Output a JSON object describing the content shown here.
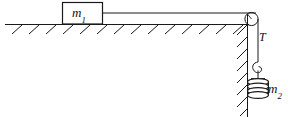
{
  "figure": {
    "kind": "physics-free-body-diagram",
    "background_color": "#ffffff",
    "line_color": "#1a1a1a"
  },
  "labels": {
    "block_mass": {
      "symbol": "m",
      "subscript": "1",
      "text": "m1"
    },
    "hanging_mass": {
      "symbol": "m",
      "subscript": "2",
      "text": "m2"
    },
    "tension": {
      "symbol": "T",
      "text": "T"
    }
  },
  "elements": {
    "ground_surface": "horizontal-hatched-support",
    "wall_surface": "vertical-hatched-support",
    "pulley": "pulley-wheel",
    "string_horizontal": "string-segment",
    "string_vertical": "string-segment",
    "hook": "hook",
    "weight_stack": {
      "name": "disc-stack",
      "disc_count": 4
    },
    "block": "rectangular-block"
  }
}
